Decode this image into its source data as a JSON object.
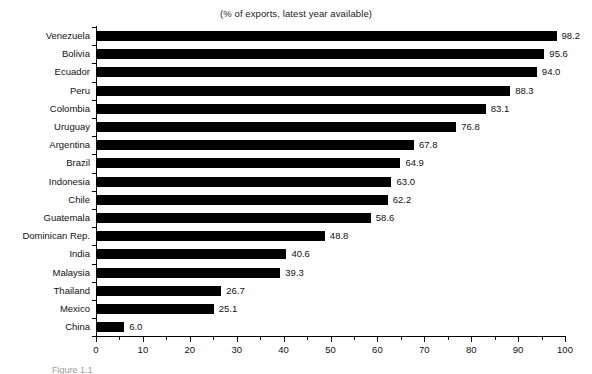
{
  "chart_data": {
    "type": "bar",
    "orientation": "horizontal",
    "title": "(% of exports, latest year available)",
    "xlabel": "",
    "ylabel": "",
    "xlim": [
      0,
      100
    ],
    "xticks": [
      0,
      10,
      20,
      30,
      40,
      50,
      60,
      70,
      80,
      90,
      100
    ],
    "grid": false,
    "legend": null,
    "bar_color": "#000000",
    "categories": [
      "Venezuela",
      "Bolivia",
      "Ecuador",
      "Peru",
      "Colombia",
      "Uruguay",
      "Argentina",
      "Brazil",
      "Indonesia",
      "Chile",
      "Guatemala",
      "Dominican Rep.",
      "India",
      "Malaysia",
      "Thailand",
      "Mexico",
      "China"
    ],
    "values": [
      98.2,
      95.6,
      94.0,
      88.3,
      83.1,
      76.8,
      67.8,
      64.9,
      63.0,
      62.2,
      58.6,
      48.8,
      40.6,
      39.3,
      26.7,
      25.1,
      6.0
    ],
    "value_labels": [
      "98.2",
      "95.6",
      "94.0",
      "88.3",
      "83.1",
      "76.8",
      "67.8",
      "64.9",
      "63.0",
      "62.2",
      "58.6",
      "48.8",
      "40.6",
      "39.3",
      "26.7",
      "25.1",
      "6.0"
    ],
    "xtick_labels": [
      "0",
      "10",
      "20",
      "30",
      "40",
      "50",
      "60",
      "70",
      "80",
      "90",
      "100"
    ]
  },
  "caption": {
    "bottom_text": "Figure 1.1"
  }
}
